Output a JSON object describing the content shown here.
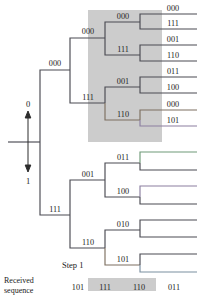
{
  "figure": {
    "step_label": "Step 1",
    "received_label_line1": "Received",
    "received_label_line2": "sequence",
    "input_up_label": "0",
    "input_down_label": "1"
  },
  "colors": {
    "shade": "#b9b9b9",
    "edge": "#4a4a52",
    "text": "#222222",
    "background": "#ffffff"
  },
  "received_sequence": [
    {
      "word": "101",
      "highlighted": false
    },
    {
      "word": "111",
      "highlighted": true
    },
    {
      "word": "110",
      "highlighted": true
    },
    {
      "word": "011",
      "highlighted": false
    }
  ],
  "tree": {
    "tier1": [
      {
        "label": "000",
        "position": "upper"
      },
      {
        "label": "111",
        "position": "lower"
      }
    ],
    "tier2": [
      {
        "label": "000",
        "parent": "000"
      },
      {
        "label": "111",
        "parent": "000"
      },
      {
        "label": "001",
        "parent": "111"
      },
      {
        "label": "110",
        "parent": "111"
      }
    ],
    "tier3": [
      {
        "label": "000",
        "parent": "000"
      },
      {
        "label": "111",
        "parent": "000"
      },
      {
        "label": "001",
        "parent": "111"
      },
      {
        "label": "110",
        "parent": "111"
      },
      {
        "label": "011",
        "parent": "001"
      },
      {
        "label": "100",
        "parent": "001"
      },
      {
        "label": "010",
        "parent": "110"
      },
      {
        "label": "101",
        "parent": "110"
      }
    ],
    "leaves_upper": [
      {
        "label": "000"
      },
      {
        "label": "111"
      },
      {
        "label": "001"
      },
      {
        "label": "110"
      },
      {
        "label": "011"
      },
      {
        "label": "100"
      },
      {
        "label": "000"
      },
      {
        "label": "101"
      }
    ]
  }
}
